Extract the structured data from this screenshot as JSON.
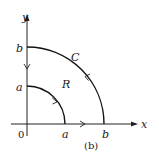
{
  "figure": {
    "caption": "(b)",
    "labels": {
      "x_axis": "x",
      "y_axis": "y",
      "origin": "0",
      "y_tick_b": "b",
      "y_tick_a": "a",
      "x_tick_a": "a",
      "x_tick_b": "b",
      "curve": "C",
      "region": "R"
    },
    "geometry": {
      "origin_px": [
        27,
        124
      ],
      "inner_radius_px": 38,
      "outer_radius_px": 77
    },
    "colors": {
      "line": "#111111",
      "background": "#ffffff"
    },
    "arrows": [
      {
        "on": "outer-arc",
        "direction": "counterclockwise"
      },
      {
        "on": "inner-arc",
        "direction": "clockwise"
      },
      {
        "on": "y-axis-segment",
        "direction": "down"
      },
      {
        "on": "x-axis-segment",
        "direction": "right"
      }
    ]
  }
}
